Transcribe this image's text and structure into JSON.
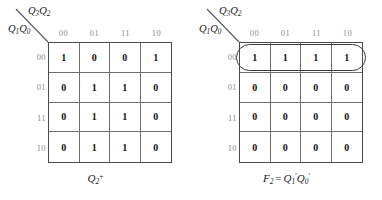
{
  "figure": {
    "kmaps": [
      {
        "id": "kmap-q2-next",
        "col_var_main": "Q",
        "col_var_sub1": "3",
        "col_var_main2": "Q",
        "col_var_sub2": "2",
        "row_var_main": "Q",
        "row_var_sub1": "1",
        "row_var_main2": "Q",
        "row_var_sub2": "0",
        "col_headers": [
          "00",
          "01",
          "11",
          "10"
        ],
        "row_headers": [
          "00",
          "01",
          "11",
          "10"
        ],
        "cells": [
          [
            "1",
            "0",
            "0",
            "1"
          ],
          [
            "0",
            "1",
            "1",
            "0"
          ],
          [
            "0",
            "1",
            "1",
            "0"
          ],
          [
            "0",
            "1",
            "1",
            "0"
          ]
        ],
        "groups": [],
        "caption": {
          "base": "Q",
          "sub": "2",
          "sup": "+",
          "equals": "",
          "rhs": ""
        }
      },
      {
        "id": "kmap-f2",
        "col_var_main": "Q",
        "col_var_sub1": "3",
        "col_var_main2": "Q",
        "col_var_sub2": "2",
        "row_var_main": "Q",
        "row_var_sub1": "1",
        "row_var_main2": "Q",
        "row_var_sub2": "0",
        "col_headers": [
          "00",
          "01",
          "11",
          "10"
        ],
        "row_headers": [
          "00",
          "01",
          "11",
          "10"
        ],
        "cells": [
          [
            "1",
            "1",
            "1",
            "1"
          ],
          [
            "0",
            "0",
            "0",
            "0"
          ],
          [
            "0",
            "0",
            "0",
            "0"
          ],
          [
            "0",
            "0",
            "0",
            "0"
          ]
        ],
        "groups": [
          {
            "name": "row-00-group",
            "row": 0,
            "col_start": 0,
            "col_span": 4
          }
        ],
        "caption": {
          "base": "F",
          "sub": "2",
          "sup": "",
          "equals": "=",
          "rhs_terms": [
            {
              "base": "Q",
              "sub": "1",
              "prime": "′"
            },
            {
              "base": "Q",
              "sub": "0",
              "prime": "′"
            }
          ]
        }
      }
    ],
    "colors": {
      "grid_outer": "#4a4a4a",
      "grid_inner": "#6e6e6e",
      "header_text": "#8d8d8d",
      "cell_text": "#111111",
      "group_outline": "#3a3a3a",
      "background": "#ffffff"
    }
  }
}
